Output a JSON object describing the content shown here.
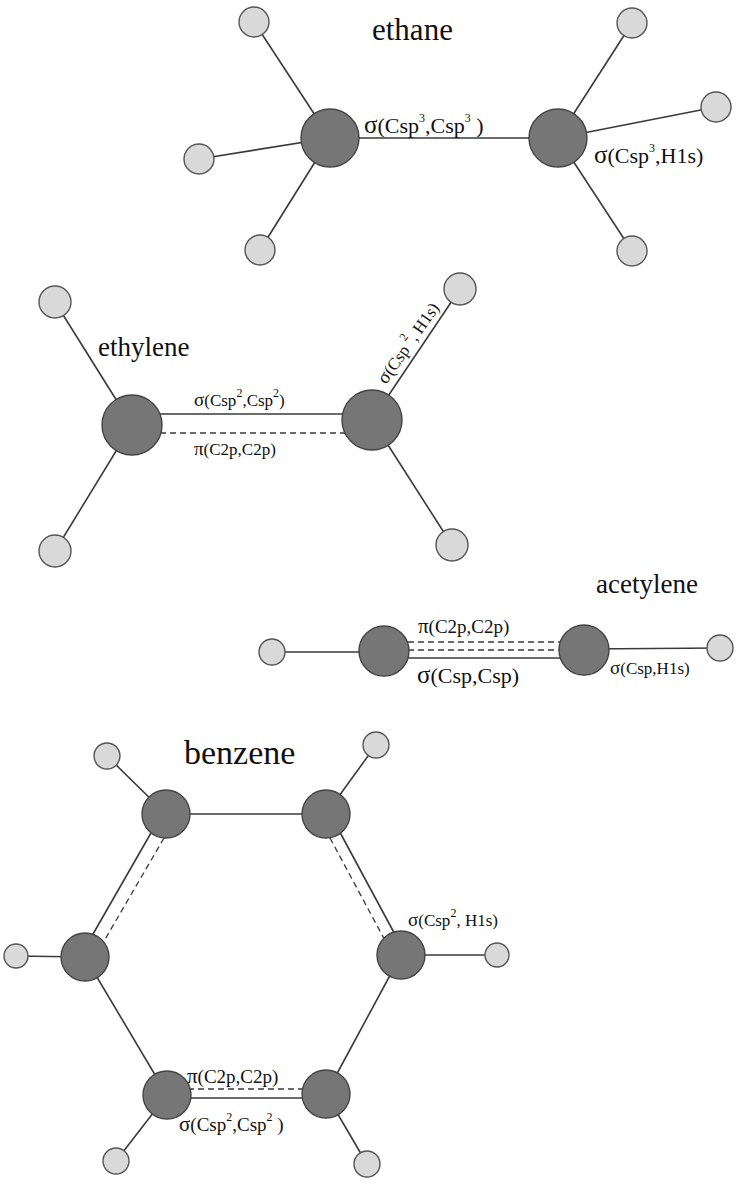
{
  "colors": {
    "carbon_fill": "#767676",
    "hydrogen_fill": "#d9d9d9",
    "bond": "#3a3a3a",
    "text": "#111111",
    "background": "#ffffff"
  },
  "molecules": {
    "ethane": {
      "title": "ethane",
      "labels": {
        "cc_sigma": {
          "greek": "σ",
          "open": "(Csp",
          "sup1": "3",
          "mid": ",Csp",
          "sup2": "3",
          "close": " )"
        },
        "ch_sigma": {
          "greek": "σ",
          "open": "(Csp",
          "sup1": "3",
          "close": ",H1s)"
        }
      }
    },
    "ethylene": {
      "title": "ethylene",
      "labels": {
        "cc_sigma": {
          "greek": "σ",
          "open": "(Csp",
          "sup1": "2",
          "mid": ",Csp",
          "sup2": "2",
          "close": ")"
        },
        "cc_pi": {
          "greek": "π",
          "text": "(C2p,C2p)"
        },
        "ch_sigma": {
          "greek": "σ",
          "open": "(Csp ",
          "sup1": "2",
          "close": ", H1s)"
        }
      }
    },
    "acetylene": {
      "title": "acetylene",
      "labels": {
        "cc_pi": {
          "greek": "π",
          "text": "(C2p,C2p)"
        },
        "cc_sigma": {
          "greek": "σ",
          "text": "(Csp,Csp)"
        },
        "ch_sigma": {
          "greek": "σ",
          "text": "(Csp,H1s)"
        }
      }
    },
    "benzene": {
      "title": "benzene",
      "labels": {
        "ch_sigma": {
          "greek": "σ",
          "open": "(Csp",
          "sup1": "2",
          "close": ", H1s)"
        },
        "cc_pi": {
          "greek": "π",
          "text": "(C2p,C2p)"
        },
        "cc_sigma": {
          "greek": "σ",
          "open": "(Csp",
          "sup1": "2",
          "mid": ",Csp",
          "sup2": "2",
          "close": " )"
        }
      }
    }
  }
}
